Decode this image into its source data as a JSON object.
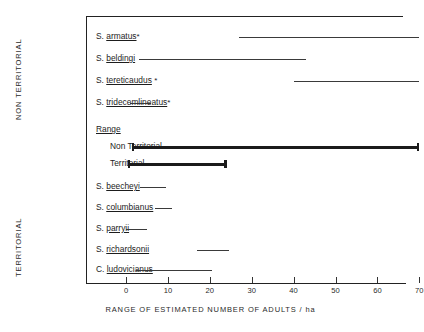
{
  "chart_data": {
    "type": "bar",
    "title": "",
    "xlabel": "RANGE OF ESTIMATED NUMBER OF ADULTS / ha",
    "ylabel": "",
    "xlim": [
      -2,
      74
    ],
    "xticks": [
      0,
      10,
      20,
      30,
      40,
      50,
      60,
      70
    ],
    "xtick_labels": [
      "0",
      "10",
      "20",
      "30",
      "40",
      "50",
      "60",
      "70"
    ],
    "grid": false,
    "legend": null,
    "orientation": "horizontal-range-bars",
    "group_labels": [
      "NON TERRITORIAL",
      "TERRITORIAL"
    ],
    "categories": [
      "S. armatus *",
      "S. beldingi",
      "S. tereticaudus *",
      "S. tridecemlineatus *",
      "Range: Non Territorial",
      "Range: Territorial",
      "S. beecheyi",
      "S. columbianus",
      "S. parryii",
      "S. richardsonii",
      "C. ludovicianus"
    ],
    "ranges": [
      [
        27,
        70
      ],
      [
        3,
        43
      ],
      [
        40,
        70
      ],
      [
        1,
        6
      ],
      [
        1.5,
        70
      ],
      [
        0.5,
        24
      ],
      [
        3.3,
        9.5
      ],
      [
        7,
        11
      ],
      [
        0,
        5
      ],
      [
        17,
        24.5
      ],
      [
        2.5,
        20.5
      ]
    ]
  },
  "axis": {
    "x_title": "RANGE OF ESTIMATED NUMBER OF ADULTS / ha",
    "ticks": [
      {
        "value": 0,
        "label": "0"
      },
      {
        "value": 10,
        "label": "10"
      },
      {
        "value": 20,
        "label": "20"
      },
      {
        "value": 30,
        "label": "30"
      },
      {
        "value": 40,
        "label": "40"
      },
      {
        "value": 50,
        "label": "50"
      },
      {
        "value": 60,
        "label": "60"
      },
      {
        "value": 70,
        "label": "70"
      }
    ]
  },
  "groups": {
    "non_territorial": "NON TERRITORIAL",
    "territorial": "TERRITORIAL"
  },
  "rows": [
    {
      "genus": "S.",
      "species": "armatus",
      "star": "*",
      "start": 27,
      "end": 70,
      "style": "thin"
    },
    {
      "genus": "S.",
      "species": "beldingi",
      "star": "",
      "start": 3,
      "end": 43,
      "style": "thin"
    },
    {
      "genus": "S.",
      "species": "tereticaudus",
      "star": "*",
      "start": 40,
      "end": 70,
      "style": "thin"
    },
    {
      "genus": "S.",
      "species": "tridecemlineatus",
      "star": "*",
      "start": 1,
      "end": 6,
      "style": "thin"
    },
    {
      "genus": "S.",
      "species": "beecheyi",
      "star": "",
      "start": 3.3,
      "end": 9.5,
      "style": "thin"
    },
    {
      "genus": "S.",
      "species": "columbianus",
      "star": "",
      "start": 7,
      "end": 11,
      "style": "thin"
    },
    {
      "genus": "S.",
      "species": "parryii",
      "star": "",
      "start": 0,
      "end": 5,
      "style": "thin"
    },
    {
      "genus": "S.",
      "species": "richardsonii",
      "star": "",
      "start": 17,
      "end": 24.5,
      "style": "thin"
    },
    {
      "genus": "C.",
      "species": "ludovicianus",
      "star": "",
      "start": 2.5,
      "end": 20.5,
      "style": "thin"
    }
  ],
  "range_block": {
    "heading": "Range",
    "non_territorial_label": "Non Territorial",
    "territorial_label": "Territorial",
    "non_territorial_start": 1.5,
    "non_territorial_end": 70,
    "territorial_start": 0.5,
    "territorial_end": 24
  },
  "colors": {
    "ink": "#1b1b1b",
    "bar": "#3a3a3a",
    "axis": "#222222",
    "background": "#ffffff"
  }
}
